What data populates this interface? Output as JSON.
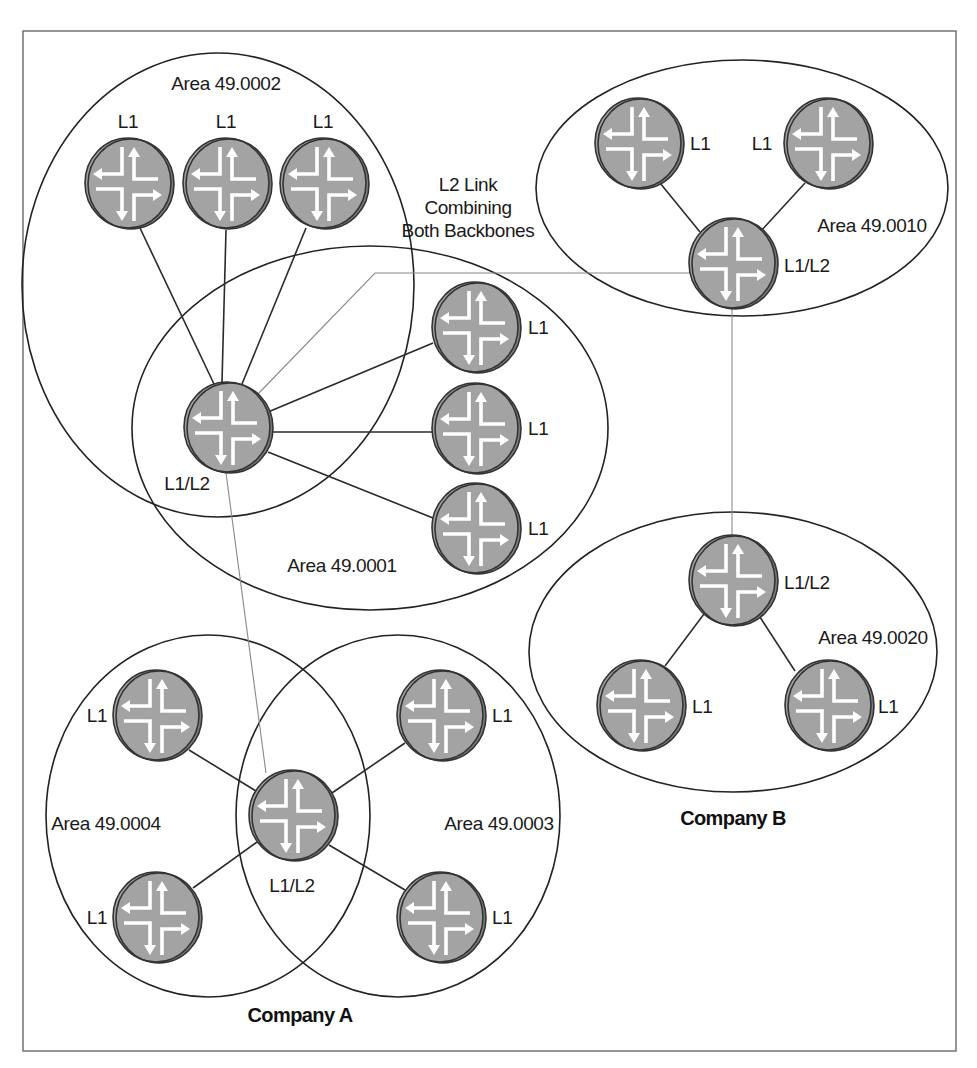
{
  "colors": {
    "router_fill": "#a3a3a3",
    "router_edge": "#7e7e7e",
    "line": "#2a2a2a",
    "l2_link": "#8a8a8a",
    "frame": "#6a6a6a"
  },
  "annotation": {
    "l2_link_line1": "L2 Link",
    "l2_link_line2": "Combining",
    "l2_link_line3": "Both Backbones"
  },
  "companies": [
    {
      "name": "Company A"
    },
    {
      "name": "Company B"
    }
  ],
  "areas": [
    {
      "id": "a0002",
      "label": "Area 49.0002"
    },
    {
      "id": "a0001",
      "label": "Area 49.0001"
    },
    {
      "id": "a0004",
      "label": "Area 49.0004"
    },
    {
      "id": "a0003",
      "label": "Area 49.0003"
    },
    {
      "id": "a0010",
      "label": "Area 49.0010"
    },
    {
      "id": "a0020",
      "label": "Area 49.0020"
    }
  ],
  "routers": [
    {
      "id": "r1",
      "level": "L1",
      "area": "Area 49.0002"
    },
    {
      "id": "r2",
      "level": "L1",
      "area": "Area 49.0002"
    },
    {
      "id": "r3",
      "level": "L1",
      "area": "Area 49.0002"
    },
    {
      "id": "r4",
      "level": "L1/L2",
      "area": "Area 49.0001 / 49.0002"
    },
    {
      "id": "r5",
      "level": "L1",
      "area": "Area 49.0001"
    },
    {
      "id": "r6",
      "level": "L1",
      "area": "Area 49.0001"
    },
    {
      "id": "r7",
      "level": "L1",
      "area": "Area 49.0001"
    },
    {
      "id": "r8",
      "level": "L1",
      "area": "Area 49.0004"
    },
    {
      "id": "r9",
      "level": "L1",
      "area": "Area 49.0004"
    },
    {
      "id": "r10",
      "level": "L1/L2",
      "area": "Area 49.0004 / 49.0003"
    },
    {
      "id": "r11",
      "level": "L1",
      "area": "Area 49.0003"
    },
    {
      "id": "r12",
      "level": "L1",
      "area": "Area 49.0003"
    },
    {
      "id": "r13",
      "level": "L1",
      "area": "Area 49.0010"
    },
    {
      "id": "r14",
      "level": "L1",
      "area": "Area 49.0010"
    },
    {
      "id": "r15",
      "level": "L1/L2",
      "area": "Area 49.0010"
    },
    {
      "id": "r16",
      "level": "L1/L2",
      "area": "Area 49.0020"
    },
    {
      "id": "r17",
      "level": "L1",
      "area": "Area 49.0020"
    },
    {
      "id": "r18",
      "level": "L1",
      "area": "Area 49.0020"
    }
  ]
}
